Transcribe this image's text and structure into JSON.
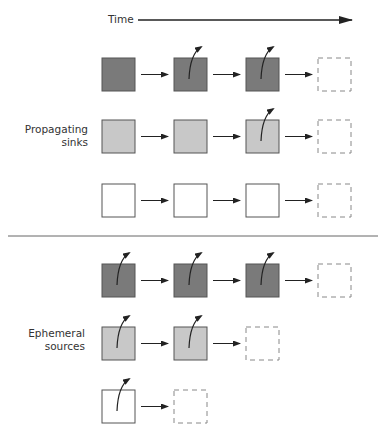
{
  "header": {
    "time_label": "Time"
  },
  "sections": [
    {
      "label_line1": "Propagating",
      "label_line2": "sinks",
      "rows": [
        {
          "fill": "#7a7a7a",
          "cells": 3,
          "emit": [
            false,
            true,
            true
          ]
        },
        {
          "fill": "#c8c8c8",
          "cells": 3,
          "emit": [
            false,
            false,
            true
          ]
        },
        {
          "fill": "#ffffff",
          "cells": 3,
          "emit": [
            false,
            false,
            false
          ]
        }
      ]
    },
    {
      "label_line1": "Ephemeral",
      "label_line2": "sources",
      "rows": [
        {
          "fill": "#7a7a7a",
          "cells": 3,
          "emit": [
            true,
            true,
            true
          ]
        },
        {
          "fill": "#c8c8c8",
          "cells": 2,
          "emit": [
            true,
            true
          ]
        },
        {
          "fill": "#ffffff",
          "cells": 1,
          "emit": [
            true
          ]
        }
      ]
    }
  ],
  "colors": {
    "stroke": "#555555",
    "arrow": "#222222",
    "dashed": "#888888"
  }
}
